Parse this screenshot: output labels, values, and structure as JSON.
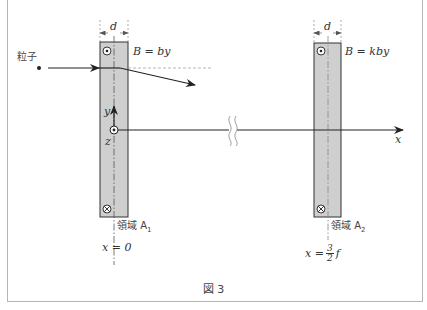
{
  "figure": {
    "caption": "図 3",
    "particle_label": "粒子",
    "axes": {
      "x_label": "x",
      "y_label": "y",
      "z_label": "z"
    },
    "regions": [
      {
        "name": "領域 A₁",
        "name_main": "領域 A",
        "name_sub": "1",
        "width_label": "d",
        "field_label": "B = by",
        "position_label": "x = 0",
        "top_symbol": "out-of-page (⊙)",
        "bottom_symbol": "into-page (⊗)"
      },
      {
        "name": "領域 A₂",
        "name_main": "領域 A",
        "name_sub": "2",
        "width_label": "d",
        "field_label": "B = kby",
        "position_lhs": "x =",
        "position_num": "3",
        "position_den": "2",
        "position_var": "f",
        "top_symbol": "out-of-page (⊙)",
        "bottom_symbol": "into-page (⊗)"
      }
    ],
    "colors": {
      "slab_fill": "#cfcfcf",
      "line": "#222222",
      "frame": "#b5b5b5"
    }
  }
}
